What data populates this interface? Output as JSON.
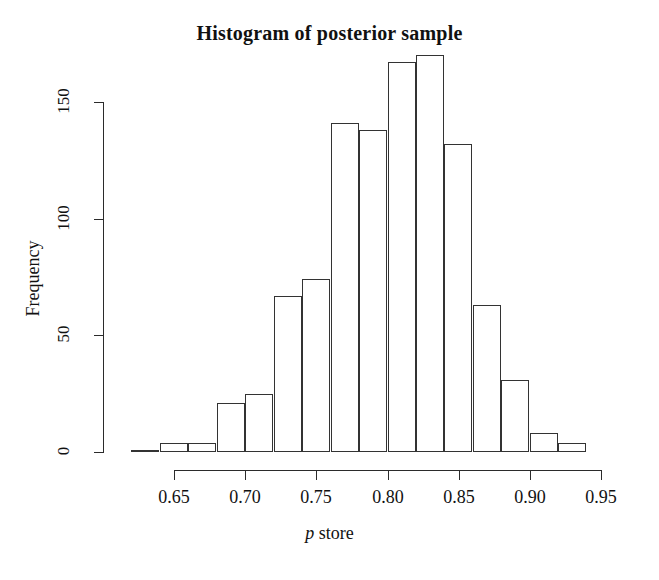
{
  "chart_data": {
    "type": "bar",
    "subtype": "histogram",
    "title": "Histogram of posterior sample",
    "xlabel": "p store",
    "xlabel_italic_part": "p",
    "ylabel": "Frequency",
    "xlim": [
      0.62,
      0.94
    ],
    "ylim": [
      0,
      170
    ],
    "grid": false,
    "legend": null,
    "bin_width": 0.02,
    "bin_edges": [
      0.62,
      0.64,
      0.66,
      0.68,
      0.7,
      0.72,
      0.74,
      0.76,
      0.78,
      0.8,
      0.82,
      0.84,
      0.86,
      0.88,
      0.9,
      0.92,
      0.94
    ],
    "bin_centers": [
      0.63,
      0.65,
      0.67,
      0.69,
      0.71,
      0.73,
      0.75,
      0.77,
      0.79,
      0.81,
      0.83,
      0.85,
      0.87,
      0.89,
      0.91,
      0.93
    ],
    "categories": [
      "0.62-0.64",
      "0.64-0.66",
      "0.66-0.68",
      "0.68-0.70",
      "0.70-0.72",
      "0.72-0.74",
      "0.74-0.76",
      "0.76-0.78",
      "0.78-0.80",
      "0.80-0.82",
      "0.82-0.84",
      "0.84-0.86",
      "0.86-0.88",
      "0.88-0.90",
      "0.90-0.92",
      "0.92-0.94"
    ],
    "values": [
      1,
      4,
      4,
      21,
      25,
      67,
      74,
      141,
      138,
      167,
      170,
      132,
      63,
      31,
      8,
      4
    ],
    "xticks": [
      0.65,
      0.7,
      0.75,
      0.8,
      0.85,
      0.9,
      0.95
    ],
    "xtick_labels": [
      "0.65",
      "0.70",
      "0.75",
      "0.80",
      "0.85",
      "0.90",
      "0.95"
    ],
    "yticks": [
      0,
      50,
      100,
      150
    ],
    "ytick_labels": [
      "0",
      "50",
      "100",
      "150"
    ],
    "bar_fill": "#ffffff",
    "bar_stroke": "#333333",
    "axis_color": "#2b2b2b",
    "text_color": "#111111",
    "background": "#ffffff"
  }
}
